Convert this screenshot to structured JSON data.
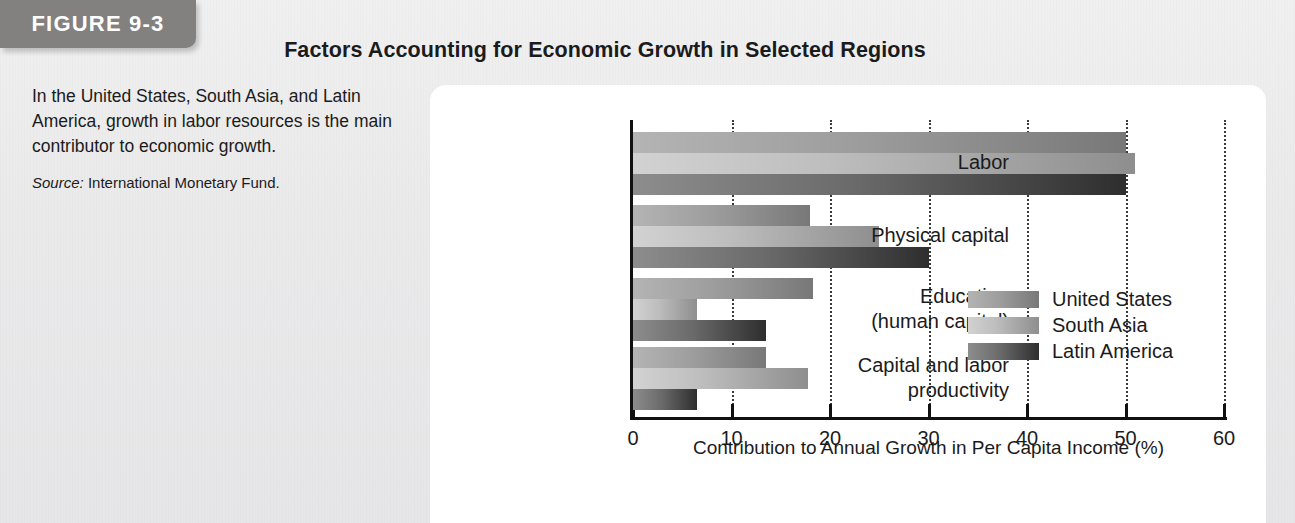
{
  "figure": {
    "tab_label": "FIGURE 9-3",
    "title": "Factors Accounting for Economic Growth in Selected Regions",
    "caption": "In the United States, South Asia, and Latin America, growth in labor resources is the main contributor to economic growth.",
    "source_prefix": "Source:",
    "source_text": "International Monetary Fund."
  },
  "chart_data": {
    "type": "bar",
    "orientation": "horizontal",
    "title": "Factors Accounting for Economic Growth in Selected Regions",
    "xlabel": "Contribution to Annual Growth in Per Capita Income (%)",
    "ylabel": "",
    "xlim": [
      0,
      60
    ],
    "xticks": [
      0,
      10,
      20,
      30,
      40,
      50,
      60
    ],
    "xtick_labels": [
      "0",
      "10",
      "20",
      "30",
      "40",
      "50",
      "60"
    ],
    "grid": "vertical dotted gridlines at each x tick",
    "legend_position": "inside middle-right",
    "categories": [
      "Labor",
      "Physical capital",
      "Education\n(human capital)",
      "Capital and labor\nproductivity"
    ],
    "series": [
      {
        "name": "United States",
        "color": "#9d9d9d",
        "values": [
          50,
          18,
          18.3,
          13.5
        ]
      },
      {
        "name": "South Asia",
        "color": "#bdbdbd",
        "values": [
          51,
          25,
          6.5,
          17.8
        ]
      },
      {
        "name": "Latin America",
        "color": "#4a4a4a",
        "values": [
          50,
          30,
          13.5,
          6.5
        ]
      }
    ]
  },
  "colors": {
    "tab_background": "#82817f",
    "panel_background": "#ffffff",
    "page_background": "#ececed",
    "axis": "#111111"
  }
}
